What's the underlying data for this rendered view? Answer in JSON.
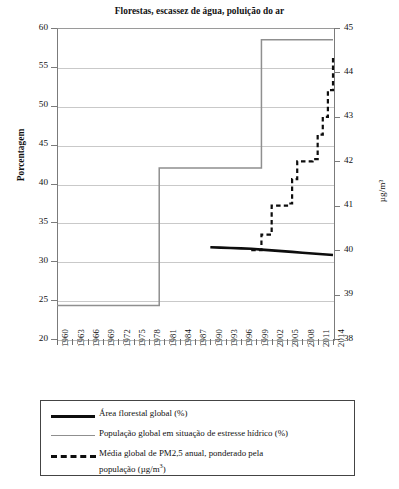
{
  "chart_data": {
    "type": "line",
    "title": "Florestas, escassez de água, poluição do ar",
    "xlabel": "",
    "ylabel": "Porcentagem",
    "ylabel_right": "µg/m³",
    "xlim": [
      1960,
      2014
    ],
    "ylim": [
      20,
      60
    ],
    "ylim_right": [
      38,
      45
    ],
    "grid": true,
    "legend_position": "bottom",
    "x_tick_labels": [
      "1960",
      "1963",
      "1966",
      "1969",
      "1972",
      "1975",
      "1978",
      "1981",
      "1984",
      "1987",
      "1990",
      "1993",
      "1996",
      "1999",
      "2002",
      "2005",
      "2008",
      "2011",
      "2014"
    ],
    "y_tick_labels_left": [
      "60",
      "55",
      "50",
      "45",
      "40",
      "35",
      "30",
      "25",
      "20"
    ],
    "y_tick_labels_right": [
      "45",
      "44",
      "43",
      "42",
      "41",
      "40",
      "39",
      "38"
    ],
    "series": [
      {
        "name": "Área florestal global (%)",
        "axis": "left",
        "style": "solid-thick",
        "color": "#0d0d0d",
        "x": [
          1990,
          1992,
          1994,
          1996,
          1998,
          2000,
          2002,
          2004,
          2006,
          2008,
          2010,
          2012,
          2014
        ],
        "values": [
          31.8,
          31.75,
          31.7,
          31.65,
          31.6,
          31.5,
          31.4,
          31.3,
          31.2,
          31.1,
          31.0,
          30.9,
          30.8
        ]
      },
      {
        "name": "População global em situação de estresse hídrico (%)",
        "axis": "left",
        "style": "solid-thin-step",
        "color": "#8f8f8f",
        "x": [
          1960,
          1980,
          1980,
          2000,
          2000,
          2014
        ],
        "values": [
          24.3,
          24.3,
          42.0,
          42.0,
          58.5,
          58.5
        ]
      },
      {
        "name": "Média global de PM2,5 anual, ponderado pela população (µg/m³)",
        "axis": "right",
        "style": "dashed",
        "color": "#0d0d0d",
        "x": [
          1998,
          1999,
          2000,
          2001,
          2002,
          2003,
          2004,
          2005,
          2006,
          2007,
          2008,
          2009,
          2010,
          2011,
          2012,
          2013,
          2014
        ],
        "values": [
          40.0,
          40.0,
          40.35,
          40.35,
          41.0,
          41.0,
          41.0,
          41.05,
          41.6,
          42.0,
          42.0,
          42.0,
          42.05,
          42.6,
          43.0,
          43.6,
          44.4
        ]
      }
    ]
  },
  "axes": {
    "left_title": "Porcentagem",
    "right_title": "µg/m³"
  },
  "legend": {
    "entries": [
      {
        "label": "Área florestal global (%)",
        "style": "thick",
        "icon": "solid-line-icon"
      },
      {
        "label": "População global em situação de estresse hídrico (%)",
        "style": "thin",
        "icon": "thin-line-icon"
      },
      {
        "label_line1": "Média global de PM2,5 anual, ponderado pela",
        "label_line2_pre": "população (",
        "label_line2_unit": "µg/m",
        "label_line2_sup": "3",
        "label_line2_post": ")",
        "style": "dashed",
        "icon": "dashed-line-icon"
      }
    ]
  }
}
